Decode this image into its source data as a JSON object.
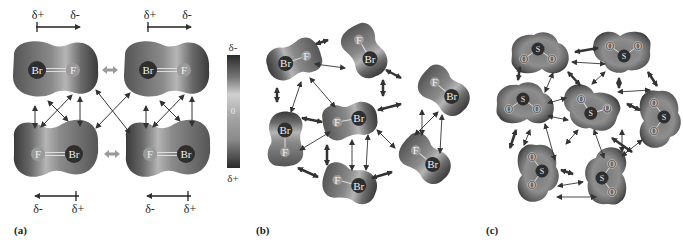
{
  "figure": {
    "panels": [
      {
        "id": "a",
        "label": "(a)"
      },
      {
        "id": "b",
        "label": "(b)"
      },
      {
        "id": "c",
        "label": "(c)"
      }
    ],
    "panel_a": {
      "molecules": [
        {
          "atoms": [
            "Br",
            "F"
          ],
          "orientation": "Br-left"
        },
        {
          "atoms": [
            "Br",
            "F"
          ],
          "orientation": "Br-left"
        },
        {
          "atoms": [
            "F",
            "Br"
          ],
          "orientation": "F-left"
        },
        {
          "atoms": [
            "F",
            "Br"
          ],
          "orientation": "F-left"
        }
      ],
      "dipole_top": {
        "start": "δ+",
        "end": "δ-"
      },
      "dipole_bottom": {
        "start": "δ-",
        "end": "δ+"
      }
    },
    "color_scale": {
      "top": "δ-",
      "middle": "0",
      "bottom": "δ+"
    },
    "panel_b": {
      "molecule": "BrF",
      "atom_labels": [
        "Br",
        "F"
      ],
      "count": 7
    },
    "panel_c": {
      "molecule": "SO2",
      "atom_labels": [
        "S",
        "O",
        "O"
      ],
      "count": 7
    },
    "colors": {
      "surface_dark": "#3a3a3a",
      "surface_mid": "#8a8a8a",
      "surface_light": "#c8c8c8",
      "arrow": "#333333",
      "repulsion_arrow": "#999999"
    }
  }
}
